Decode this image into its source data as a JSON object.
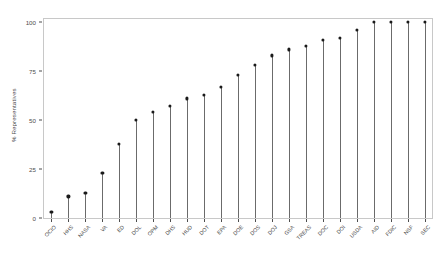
{
  "chart_data": {
    "type": "bar",
    "subtype": "lollipop",
    "title": "",
    "subtitle": "",
    "xlabel": "",
    "ylabel": "% Representatives",
    "ylim": [
      0,
      100
    ],
    "yticks": [
      0,
      25,
      50,
      75,
      100
    ],
    "ytick_labels": [
      "0",
      "25",
      "50",
      "75",
      "100"
    ],
    "grid": false,
    "legend": null,
    "categories": [
      "OCIO",
      "HHS",
      "NASA",
      "VA",
      "ED",
      "DOL",
      "OPM",
      "DHS",
      "HUD",
      "DOT",
      "EPA",
      "DOE",
      "DOS",
      "DOJ",
      "GSA",
      "TREAS",
      "DOC",
      "DOI",
      "USDA",
      "AID",
      "FDIC",
      "NSF",
      "SEC"
    ],
    "values": [
      3,
      11,
      13,
      23,
      38,
      50,
      54,
      57,
      61,
      63,
      67,
      73,
      78,
      83,
      86,
      88,
      91,
      92,
      96,
      100,
      100,
      100,
      100
    ],
    "point_color": "#1a1a1a",
    "stem_color": "#6b6b6b",
    "panel_border_color": "#c8c8c8",
    "axis_text_color": "#4d4d4d",
    "background_color": "#ffffff"
  }
}
